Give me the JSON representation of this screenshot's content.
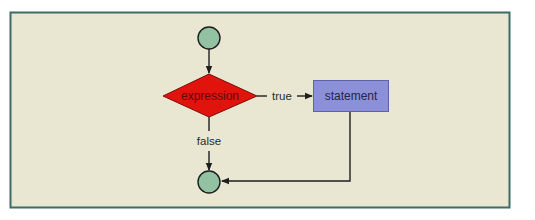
{
  "diagram": {
    "type": "flowchart",
    "title": "",
    "colors": {
      "page_background": "#ffffff",
      "frame_background": "#e9e6d2",
      "frame_border": "#3f6b66",
      "terminal_fill": "#93c2a3",
      "decision_fill": "#e0140d",
      "decision_text": "#5a0a08",
      "process_fill": "#8c90d8",
      "process_border": "#5e62a8",
      "process_text": "#22264a",
      "line": "#1e1e1e",
      "edge_label_text": "#2a2a2a"
    },
    "nodes": [
      {
        "id": "start",
        "shape": "circle",
        "label": ""
      },
      {
        "id": "decision",
        "shape": "diamond",
        "label": "expression"
      },
      {
        "id": "process",
        "shape": "rectangle",
        "label": "statement"
      },
      {
        "id": "end",
        "shape": "circle",
        "label": ""
      }
    ],
    "edges": [
      {
        "from": "start",
        "to": "decision",
        "label": ""
      },
      {
        "from": "decision",
        "to": "process",
        "label": "true"
      },
      {
        "from": "decision",
        "to": "end",
        "label": "false"
      },
      {
        "from": "process",
        "to": "end",
        "label": ""
      }
    ],
    "labels": {
      "decision": "expression",
      "process": "statement",
      "true_edge": "true",
      "false_edge": "false"
    }
  }
}
